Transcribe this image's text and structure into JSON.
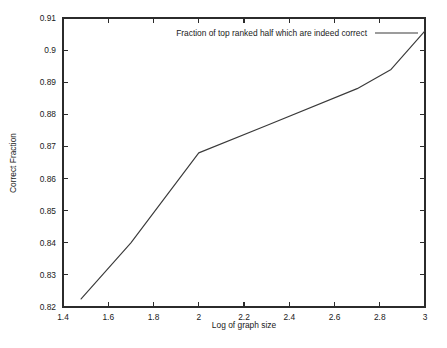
{
  "chart_data": {
    "type": "line",
    "title": "",
    "xlabel": "Log of graph size",
    "ylabel": "Correct Fraction",
    "xlim": [
      1.4,
      3.0
    ],
    "ylim": [
      0.82,
      0.91
    ],
    "grid": false,
    "legend_position": "top-right",
    "xticks": [
      "1.4",
      "1.6",
      "1.8",
      "2",
      "2.2",
      "2.4",
      "2.6",
      "2.8",
      "3"
    ],
    "xtick_values": [
      1.4,
      1.6,
      1.8,
      2.0,
      2.2,
      2.4,
      2.6,
      2.8,
      3.0
    ],
    "yticks": [
      "0.82",
      "0.83",
      "0.84",
      "0.85",
      "0.86",
      "0.87",
      "0.88",
      "0.89",
      "0.9",
      "0.91"
    ],
    "ytick_values": [
      0.82,
      0.83,
      0.84,
      0.85,
      0.86,
      0.87,
      0.88,
      0.89,
      0.9,
      0.91
    ],
    "series": [
      {
        "name": "Fraction of top ranked half which are indeed correct",
        "x": [
          1.48,
          1.7,
          2.0,
          2.3,
          2.7,
          2.85,
          3.0
        ],
        "values": [
          0.8225,
          0.84,
          0.868,
          0.8765,
          0.888,
          0.894,
          0.906
        ]
      }
    ]
  },
  "legend": {
    "entries": [
      {
        "label": "Fraction of top ranked half which are indeed correct"
      }
    ]
  },
  "axes": {
    "x_title": "Log of graph size",
    "y_title": "Correct Fraction"
  }
}
